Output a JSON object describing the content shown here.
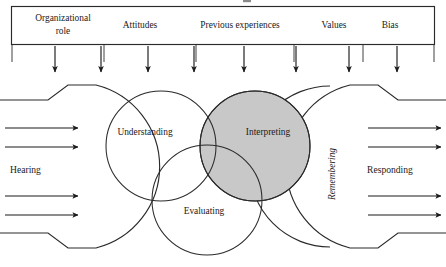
{
  "diagram": {
    "colors": {
      "stroke": "#2a2a2a",
      "text": "#1b1b1b",
      "shaded_circle_fill": "#c8c8c8",
      "background": "#ffffff"
    },
    "influences_box": {
      "name": "influencing-factors-box",
      "items": [
        {
          "label": "Organizational role",
          "lines": [
            "Organizational",
            "role"
          ],
          "x": 63
        },
        {
          "label": "Attitudes",
          "lines": [
            "Attitudes"
          ],
          "x": 140
        },
        {
          "label": "Previous experiences",
          "lines": [
            "Previous experiences"
          ],
          "x": 240
        },
        {
          "label": "Values",
          "lines": [
            "Values"
          ],
          "x": 334
        },
        {
          "label": "Bias",
          "lines": [
            "Bias"
          ],
          "x": 390
        }
      ],
      "dividers_x": [
        104,
        196,
        294,
        363
      ],
      "down_arrows_x": [
        55,
        101,
        148,
        194,
        244,
        296,
        349,
        397
      ]
    },
    "venn": {
      "name": "listening-venn",
      "circles": [
        {
          "label": "Understanding",
          "cx": 161,
          "cy": 146,
          "r": 55,
          "shaded": false,
          "label_x": 145,
          "label_y": 133
        },
        {
          "label": "Interpreting",
          "cx": 255,
          "cy": 146,
          "r": 55,
          "shaded": true,
          "label_x": 268,
          "label_y": 133
        },
        {
          "label": "Evaluating",
          "cx": 207,
          "cy": 200,
          "r": 55,
          "shaded": false,
          "label_x": 204,
          "label_y": 212
        }
      ]
    },
    "flows": {
      "input": {
        "label": "Hearing",
        "name": "hearing-flow",
        "label_x": 40,
        "label_y": 171,
        "arrow_rows_y": [
          128,
          147,
          196,
          215
        ],
        "arrow_x_start": 5,
        "arrow_x_end": 78
      },
      "output": {
        "label": "Responding",
        "name": "responding-flow",
        "label_x": 405,
        "label_y": 171,
        "arrow_rows_y": [
          128,
          147,
          196,
          215
        ],
        "arrow_x_start": 368,
        "arrow_x_end": 441
      },
      "middle": {
        "label": "Remembering",
        "name": "remembering-band",
        "label_x": 333,
        "label_y": 174,
        "rotation": -90
      }
    }
  }
}
